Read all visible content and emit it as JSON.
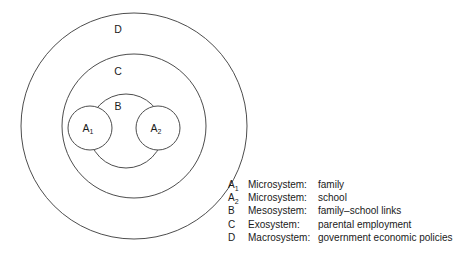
{
  "diagram": {
    "type": "nested-circles-venn",
    "title": "",
    "background_color": "#ffffff",
    "stroke_color": "#4d4d4d",
    "text_color": "#1a1a1a",
    "rings": [
      {
        "id": "D",
        "label": "D",
        "cx": 134,
        "cy": 126,
        "r": 113,
        "label_x": 118,
        "label_y": 30
      },
      {
        "id": "C",
        "label": "C",
        "cx": 134,
        "cy": 126,
        "r": 72,
        "label_x": 118,
        "label_y": 72
      },
      {
        "id": "B",
        "label": "B",
        "cx": 126,
        "cy": 131,
        "r": 37,
        "label_x": 118,
        "label_y": 107
      }
    ],
    "nodes": [
      {
        "id": "A1",
        "label": "A",
        "subscript": "1",
        "cx": 90,
        "cy": 128,
        "r": 22
      },
      {
        "id": "A2",
        "label": "A",
        "subscript": "2",
        "cx": 158,
        "cy": 128,
        "r": 22
      }
    ]
  },
  "legend": {
    "rows": [
      {
        "key": "A",
        "key_sub": "1",
        "term": "Microsystem:",
        "description": "family"
      },
      {
        "key": "A",
        "key_sub": "2",
        "term": "Microsystem:",
        "description": "school"
      },
      {
        "key": "B",
        "key_sub": "",
        "term": "Mesosystem:",
        "description": "family–school links"
      },
      {
        "key": "C",
        "key_sub": "",
        "term": "Exosystem:",
        "description": "parental employment"
      },
      {
        "key": "D",
        "key_sub": "",
        "term": "Macrosystem:",
        "description": "government economic policies"
      }
    ]
  }
}
